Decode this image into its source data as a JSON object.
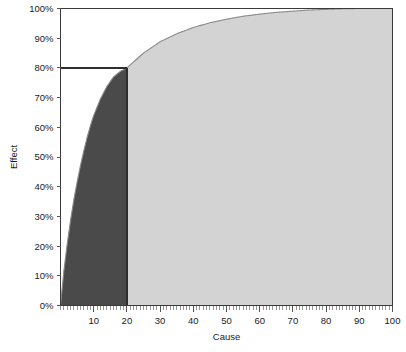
{
  "chart_data": {
    "type": "area",
    "title": "",
    "xlabel": "Cause",
    "ylabel": "Effect",
    "xlim": [
      0,
      100
    ],
    "ylim": [
      0,
      100
    ],
    "grid": false,
    "legend": "none",
    "x_tick_labels": [
      "10",
      "20",
      "30",
      "40",
      "50",
      "60",
      "70",
      "80",
      "90",
      "100"
    ],
    "x_tick_values": [
      10,
      20,
      30,
      40,
      50,
      60,
      70,
      80,
      90,
      100
    ],
    "x_minor_tick_step": 1,
    "y_tick_labels": [
      "0%",
      "10%",
      "20%",
      "30%",
      "40%",
      "50%",
      "60%",
      "70%",
      "80%",
      "90%",
      "100%"
    ],
    "y_tick_values": [
      0,
      10,
      20,
      30,
      40,
      50,
      60,
      70,
      80,
      90,
      100
    ],
    "x": [
      0,
      1,
      2,
      3,
      4,
      5,
      6,
      7,
      8,
      9,
      10,
      12,
      14,
      16,
      18,
      20,
      25,
      30,
      35,
      40,
      45,
      50,
      55,
      60,
      65,
      70,
      75,
      80,
      85,
      90,
      95,
      100
    ],
    "series": [
      {
        "name": "Cumulative effect",
        "values": [
          0,
          11.5,
          20.5,
          28.5,
          35.5,
          41.5,
          47.0,
          52.0,
          56.5,
          60.5,
          64.0,
          69.5,
          73.8,
          77.0,
          78.8,
          80.0,
          85.0,
          88.8,
          91.5,
          93.6,
          95.2,
          96.4,
          97.4,
          98.1,
          98.7,
          99.1,
          99.5,
          99.7,
          99.9,
          100.0,
          100.0,
          100.0
        ]
      }
    ],
    "annotations": {
      "reference_line_y": 80,
      "reference_line_y_label": "80%",
      "split_x": 20,
      "split_x_label": "20"
    },
    "regions": [
      {
        "name": "vital-few",
        "x_from": 0,
        "x_to": 20,
        "color": "#4a4a4a"
      },
      {
        "name": "trivial-many",
        "x_from": 20,
        "x_to": 100,
        "color": "#d3d3d3"
      }
    ],
    "colors": {
      "dark_region": "#4a4a4a",
      "light_region": "#d3d3d3",
      "axis": "#3a3a3a",
      "curve": "#8a8a8a",
      "reference_line": "#2e2e2e",
      "background": "#ffffff",
      "text": "#1a1a1a"
    }
  }
}
